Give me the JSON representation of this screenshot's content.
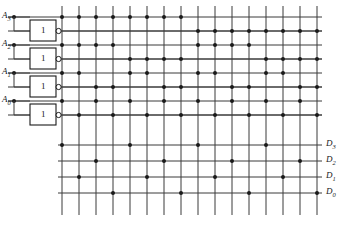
{
  "diagram": {
    "kind": "logic-circuit-array",
    "ink_color": "#1a1a1a",
    "line_color": "#3a3a3a",
    "background": "#ffffff"
  },
  "inputs": [
    {
      "name": "A3",
      "label": "A",
      "sub": "3",
      "y": 17,
      "gate_label": "1"
    },
    {
      "name": "A2",
      "label": "A",
      "sub": "2",
      "y": 45,
      "gate_label": "1"
    },
    {
      "name": "A1",
      "label": "A",
      "sub": "1",
      "y": 73,
      "gate_label": "1"
    },
    {
      "name": "A0",
      "label": "A",
      "sub": "0",
      "y": 101,
      "gate_label": "1"
    }
  ],
  "gates": {
    "symbol_text": "1",
    "type": "inverter",
    "count": 4,
    "box": {
      "x": 30,
      "width": 26,
      "height": 21
    },
    "bubble_radius": 2.6
  },
  "outputs": [
    {
      "name": "D3",
      "label": "D",
      "sub": "3",
      "y": 145
    },
    {
      "name": "D2",
      "label": "D",
      "sub": "2",
      "y": 161
    },
    {
      "name": "D1",
      "label": "D",
      "sub": "1",
      "y": 177
    },
    {
      "name": "D0",
      "label": "D",
      "sub": "0",
      "y": 193
    }
  ],
  "grid": {
    "vertical_lines": 16,
    "v_x_start": 62,
    "v_x_step": 17,
    "v_y_top": 6,
    "v_y_bottom": 215,
    "h_x_left": 8,
    "h_x_right": 322,
    "rows": [
      {
        "name": "A3-true",
        "y": 17,
        "kind": "input-true"
      },
      {
        "name": "A3-comp",
        "y": 31,
        "kind": "input-complement"
      },
      {
        "name": "A2-true",
        "y": 45,
        "kind": "input-true"
      },
      {
        "name": "A2-comp",
        "y": 59,
        "kind": "input-complement"
      },
      {
        "name": "A1-true",
        "y": 73,
        "kind": "input-true"
      },
      {
        "name": "A1-comp",
        "y": 87,
        "kind": "input-complement"
      },
      {
        "name": "A0-true",
        "y": 101,
        "kind": "input-true"
      },
      {
        "name": "A0-comp",
        "y": 115,
        "kind": "input-complement"
      },
      {
        "name": "D3",
        "y": 145,
        "kind": "output"
      },
      {
        "name": "D2",
        "y": 161,
        "kind": "output"
      },
      {
        "name": "D1",
        "y": 177,
        "kind": "output"
      },
      {
        "name": "D0",
        "y": 193,
        "kind": "output"
      }
    ],
    "junction_dot_radius": 2.0
  },
  "connections": {
    "note": "Per row, the list gives the 0-based indices of the 16 vertical lines that carry a connection dot.",
    "rows": [
      {
        "row": "A3-true",
        "columns": [
          0,
          1,
          2,
          3,
          4,
          5,
          6,
          7
        ]
      },
      {
        "row": "A3-comp",
        "columns": [
          8,
          9,
          10,
          11,
          12,
          13,
          14,
          15
        ]
      },
      {
        "row": "A2-true",
        "columns": [
          0,
          1,
          2,
          3,
          8,
          9,
          10,
          11
        ]
      },
      {
        "row": "A2-comp",
        "columns": [
          4,
          5,
          6,
          7,
          12,
          13,
          14,
          15
        ]
      },
      {
        "row": "A1-true",
        "columns": [
          0,
          1,
          4,
          5,
          8,
          9,
          12,
          13
        ]
      },
      {
        "row": "A1-comp",
        "columns": [
          2,
          3,
          6,
          7,
          10,
          11,
          14,
          15
        ]
      },
      {
        "row": "A0-true",
        "columns": [
          0,
          2,
          4,
          6,
          8,
          10,
          12,
          14
        ]
      },
      {
        "row": "A0-comp",
        "columns": [
          1,
          3,
          5,
          7,
          9,
          11,
          13,
          15
        ]
      },
      {
        "row": "D3",
        "columns": [
          0,
          4,
          8,
          12
        ]
      },
      {
        "row": "D2",
        "columns": [
          2,
          6,
          10,
          14
        ]
      },
      {
        "row": "D1",
        "columns": [
          1,
          5,
          9,
          13
        ]
      },
      {
        "row": "D0",
        "columns": [
          3,
          7,
          11,
          15
        ]
      }
    ]
  }
}
